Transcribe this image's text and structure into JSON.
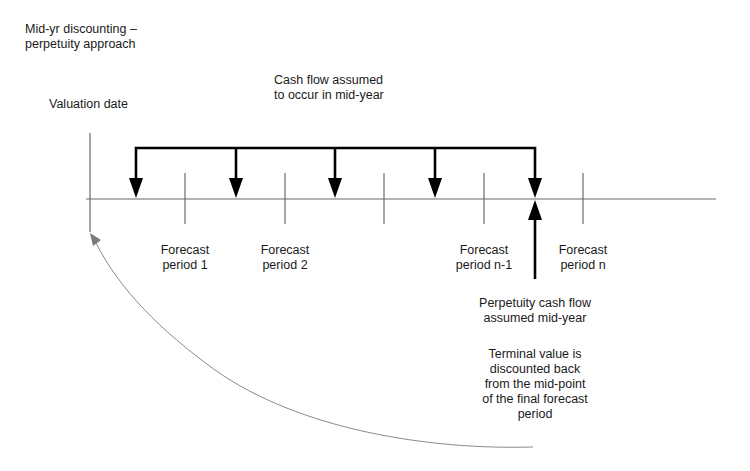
{
  "title": {
    "line1": "Mid-yr discounting –",
    "line2": "perpetuity approach"
  },
  "valuation_date": "Valuation date",
  "cash_flow_note": {
    "line1": "Cash flow assumed",
    "line2": "to occur in mid-year"
  },
  "periods": [
    {
      "line1": "Forecast",
      "line2": "period 1"
    },
    {
      "line1": "Forecast",
      "line2": "period 2"
    },
    {
      "line1": "Forecast",
      "line2": "period n-1"
    },
    {
      "line1": "Forecast",
      "line2": "period n"
    }
  ],
  "perpetuity_note": {
    "line1": "Perpetuity cash flow",
    "line2": "assumed mid-year"
  },
  "terminal_note": {
    "line1": "Terminal value is",
    "line2": "discounted back",
    "line3": "from the mid-point",
    "line4": "of the final forecast",
    "line5": "period"
  },
  "colors": {
    "axis": "#6b6b6b",
    "arrows": "#000000",
    "curve": "#8a8a8a",
    "text": "#1a1a1a"
  }
}
